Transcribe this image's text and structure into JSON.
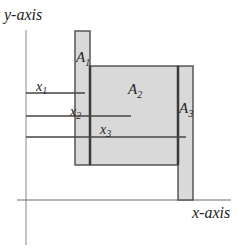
{
  "diagram": {
    "axes": {
      "y_label": "y-axis",
      "x_label": "x-axis"
    },
    "regions": [
      {
        "id": "A1",
        "label": "A",
        "subscript": "1"
      },
      {
        "id": "A2",
        "label": "A",
        "subscript": "2"
      },
      {
        "id": "A3",
        "label": "A",
        "subscript": "3"
      }
    ],
    "distance_lines": [
      {
        "id": "x1",
        "label": "x",
        "subscript": "1"
      },
      {
        "id": "x2",
        "label": "x",
        "subscript": "2"
      },
      {
        "id": "x3",
        "label": "x",
        "subscript": "3"
      }
    ],
    "colors": {
      "fill": "#d9d9d9",
      "stroke": "#3a3a3a",
      "axis": "#8a8a8a",
      "line": "#444444"
    }
  }
}
